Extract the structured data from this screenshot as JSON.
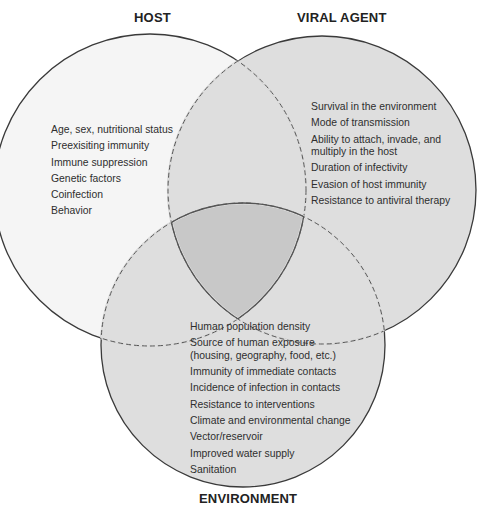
{
  "titles": {
    "host": "HOST",
    "viral": "VIRAL AGENT",
    "environment": "ENVIRONMENT"
  },
  "host_factors": [
    "Age, sex, nutritional status",
    "Preexisiting immunity",
    "Immune suppression",
    "Genetic factors",
    "Coinfection",
    "Behavior"
  ],
  "viral_factors": [
    "Survival in the environment",
    "Mode of transmission",
    "Ability to attach, invade, and multiply in the host",
    "Duration of infectivity",
    "Evasion of host immunity",
    "Resistance to antiviral therapy"
  ],
  "environment_factors": [
    "Human population density",
    "Source of human exposure (housing, geography, food, etc.)",
    "Immunity of immediate contacts",
    "Incidence of infection in contacts",
    "Resistance to interventions",
    "Climate and environmental change",
    "Vector/reservoir",
    "Improved water supply",
    "Sanitation"
  ],
  "colors": {
    "host_fill": "#f5f5f5",
    "viral_fill": "#dedede",
    "environment_fill": "#dedede",
    "center_fill": "#c8c8c8",
    "stroke": "#3a3a3a"
  }
}
